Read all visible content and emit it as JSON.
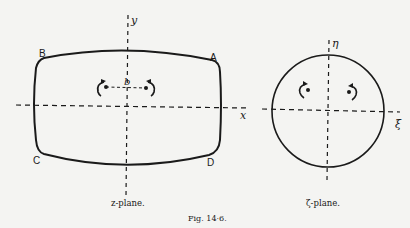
{
  "figure": {
    "caption": "Fig. 14·6.",
    "colors": {
      "ink": "#1a1a1a",
      "paper": "#f4f4f2"
    }
  },
  "z_plane": {
    "caption": "z-plane.",
    "axis_x_label": "x",
    "axis_y_label": "y",
    "corner_labels": {
      "A": "A",
      "B": "B",
      "C": "C",
      "D": "D"
    },
    "vortex_separation_label": "b",
    "vortices": [
      {
        "position": "left",
        "rotation": "counterclockwise"
      },
      {
        "position": "right",
        "rotation": "clockwise"
      }
    ]
  },
  "zeta_plane": {
    "caption": "ζ-plane.",
    "axis_x_label": "ξ",
    "axis_y_label": "η",
    "vortices": [
      {
        "position": "left",
        "rotation": "counterclockwise"
      },
      {
        "position": "right",
        "rotation": "clockwise"
      }
    ]
  }
}
